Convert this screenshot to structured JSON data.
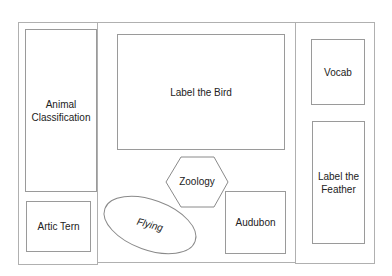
{
  "diagram": {
    "left_panel": {
      "animal_classification": "Animal Classification",
      "artic_tern": "Artic Tern"
    },
    "center_panel": {
      "label_the_bird": "Label the Bird",
      "zoology": "Zoology",
      "flying": "Flying",
      "audubon": "Audubon"
    },
    "right_panel": {
      "vocab": "Vocab",
      "label_the_feather": "Label the Feather"
    },
    "colors": {
      "border": "#9a9a9a",
      "text": "#222222",
      "background": "#ffffff"
    }
  }
}
